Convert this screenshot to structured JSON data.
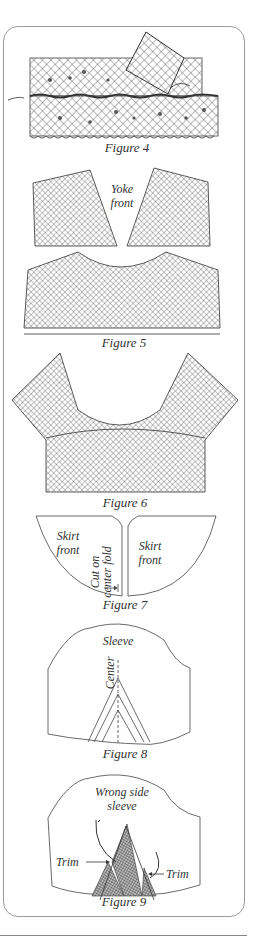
{
  "figures": {
    "fig4": {
      "caption": "Figure 4"
    },
    "fig5": {
      "caption": "Figure 5",
      "label_line1": "Yoke",
      "label_line2": "front"
    },
    "fig6": {
      "caption": "Figure 6"
    },
    "fig7": {
      "caption": "Figure 7",
      "left_line1": "Skirt",
      "left_line2": "front",
      "right_line1": "Skirt",
      "right_line2": "front",
      "fold_line1": "Cut on",
      "fold_line2": "center fold"
    },
    "fig8": {
      "caption": "Figure 8",
      "label": "Sleeve",
      "center_label": "Center"
    },
    "fig9": {
      "caption": "Figure 9",
      "label_line1": "Wrong side",
      "label_line2": "sleeve",
      "trim_left": "Trim",
      "trim_right": "Trim"
    }
  },
  "colors": {
    "ink": "#333333",
    "border": "#9a9a9a",
    "lace_fill": "#d8d8d8"
  }
}
